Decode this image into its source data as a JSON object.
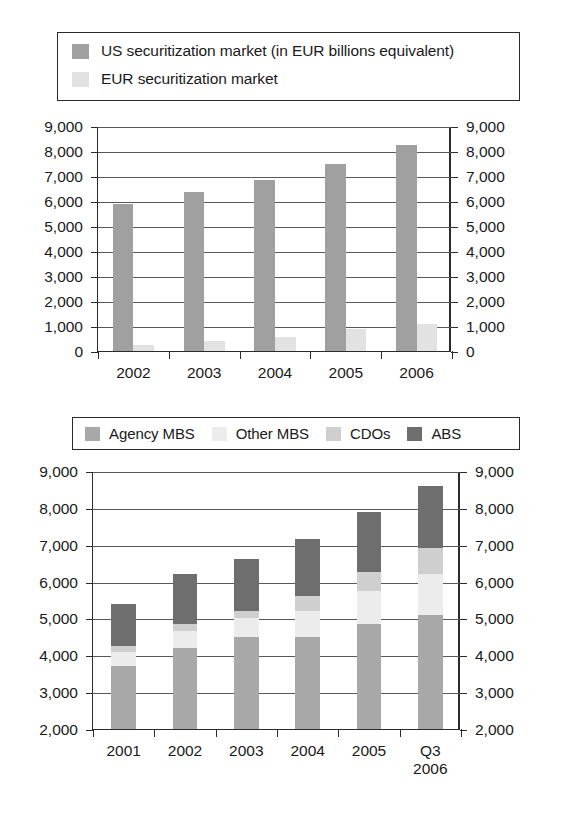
{
  "colors": {
    "us_market": "#a0a0a0",
    "eur_market": "#e2e2e2",
    "agency_mbs": "#a8a8a8",
    "other_mbs": "#ececec",
    "cdos": "#cfcfcf",
    "abs": "#6e6e6e",
    "axis": "#2b2b2b",
    "grid": "#585858"
  },
  "legend_top": {
    "items": [
      {
        "label": "US securitization market (in EUR billions equivalent)",
        "color_key": "us_market",
        "icon": "legend-swatch-icon"
      },
      {
        "label": "EUR securitization market",
        "color_key": "eur_market",
        "icon": "legend-swatch-icon"
      }
    ]
  },
  "legend_bottom": {
    "items": [
      {
        "label": "Agency MBS",
        "color_key": "agency_mbs",
        "icon": "legend-swatch-icon"
      },
      {
        "label": "Other MBS",
        "color_key": "other_mbs",
        "icon": "legend-swatch-icon"
      },
      {
        "label": "CDOs",
        "color_key": "cdos",
        "icon": "legend-swatch-icon"
      },
      {
        "label": "ABS",
        "color_key": "abs",
        "icon": "legend-swatch-icon"
      }
    ]
  },
  "chart_data": [
    {
      "id": "us-vs-eur-securitization",
      "type": "bar",
      "title": "",
      "xlabel": "",
      "ylabel": "",
      "ylim": [
        0,
        9000
      ],
      "ytick_step": 1000,
      "yticks": [
        0,
        1000,
        2000,
        3000,
        4000,
        5000,
        6000,
        7000,
        8000,
        9000
      ],
      "ytick_labels": [
        "0",
        "1,000",
        "2,000",
        "3,000",
        "4,000",
        "5,000",
        "6,000",
        "7,000",
        "8,000",
        "9,000"
      ],
      "dual_axis": true,
      "grid": true,
      "legend_position": "top",
      "categories": [
        "2002",
        "2003",
        "2004",
        "2005",
        "2006"
      ],
      "series": [
        {
          "name": "US securitization market (in EUR billions equivalent)",
          "color_key": "us_market",
          "values": [
            5900,
            6350,
            6850,
            7500,
            8250
          ]
        },
        {
          "name": "EUR securitization market",
          "color_key": "eur_market",
          "values": [
            250,
            400,
            550,
            900,
            1100
          ]
        }
      ]
    },
    {
      "id": "securitization-by-collateral-type",
      "type": "bar",
      "stacked": true,
      "title": "",
      "xlabel": "",
      "ylabel": "",
      "ylim": [
        2000,
        9000
      ],
      "ytick_step": 1000,
      "yticks": [
        2000,
        3000,
        4000,
        5000,
        6000,
        7000,
        8000,
        9000
      ],
      "ytick_labels": [
        "2,000",
        "3,000",
        "4,000",
        "5,000",
        "6,000",
        "7,000",
        "8,000",
        "9,000"
      ],
      "dual_axis": true,
      "grid": true,
      "legend_position": "top",
      "categories": [
        "2001",
        "2002",
        "2003",
        "2004",
        "2005",
        "Q3\n2006"
      ],
      "category_lines": [
        [
          "2001"
        ],
        [
          "2002"
        ],
        [
          "2003"
        ],
        [
          "2004"
        ],
        [
          "2005"
        ],
        [
          "Q3",
          "2006"
        ]
      ],
      "series": [
        {
          "name": "Agency MBS",
          "color_key": "agency_mbs",
          "values": [
            3700,
            4200,
            4500,
            4500,
            4850,
            5100
          ]
        },
        {
          "name": "Other MBS",
          "color_key": "other_mbs",
          "values": [
            400,
            450,
            500,
            700,
            900,
            1100
          ]
        },
        {
          "name": "CDOs",
          "color_key": "cdos",
          "values": [
            150,
            200,
            200,
            400,
            500,
            700
          ]
        },
        {
          "name": "ABS",
          "color_key": "abs",
          "values": [
            1150,
            1350,
            1400,
            1550,
            1650,
            1700
          ]
        }
      ],
      "cumulative_tops": [
        [
          3700,
          4100,
          4250,
          5400
        ],
        [
          4200,
          4650,
          4850,
          6200
        ],
        [
          4500,
          5000,
          5200,
          6600
        ],
        [
          4500,
          5200,
          5600,
          7150
        ],
        [
          4850,
          5750,
          6250,
          7900
        ],
        [
          5100,
          6200,
          6900,
          8600
        ]
      ]
    }
  ]
}
